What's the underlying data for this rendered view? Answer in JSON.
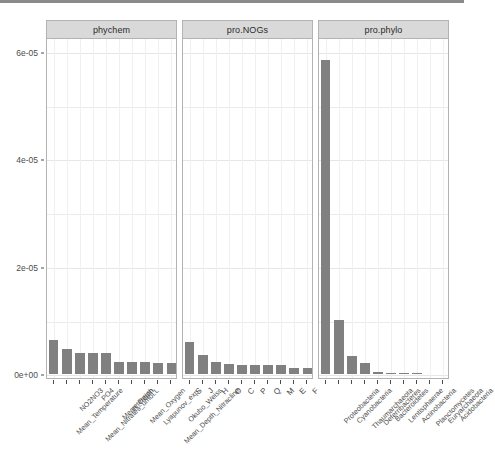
{
  "chart_data": {
    "type": "bar",
    "title": "",
    "xlabel": "",
    "ylabel": "",
    "ylim": [
      0,
      6.32e-05
    ],
    "grid": true,
    "legend_position": "none",
    "facet_strips": [
      "phychem",
      "pro.NOGs",
      "pro.phylo"
    ],
    "y_ticks": [
      "0e+00",
      "2e-05",
      "4e-05",
      "6e-05"
    ],
    "y_tick_values": [
      0,
      2e-05,
      4e-05,
      6e-05
    ],
    "bar_color": "#808080",
    "strip_color": "#d9d9d9",
    "panel_border_color": "#b3b3b3",
    "grid_color": "#ebebeb",
    "panels": [
      {
        "name": "phychem",
        "categories": [
          "Mean_Temperature",
          "NO2NO3",
          "Mean_Nitrates_umol.L",
          "PO4",
          "Mean_Depth",
          "retention",
          "Mean_Oxygen",
          "Lyapunov_exp.",
          "Mean_Depth_Nitracline",
          "Okubo_Weiss"
        ],
        "values": [
          6.3e-06,
          4.6e-06,
          4e-06,
          4e-06,
          3.9e-06,
          2.3e-06,
          2.2e-06,
          2.2e-06,
          2.1e-06,
          2.1e-06
        ]
      },
      {
        "name": "pro.NOGs",
        "categories": [
          "S",
          "J",
          "H",
          "O",
          "C",
          "P",
          "Q",
          "M",
          "E",
          "F"
        ],
        "values": [
          5.9e-06,
          3.5e-06,
          2.3e-06,
          1.8e-06,
          1.7e-06,
          1.7e-06,
          1.6e-06,
          1.6e-06,
          1.2e-06,
          1.1e-06
        ]
      },
      {
        "name": "pro.phylo",
        "categories": [
          "Proteobacteria",
          "Cyanobacteria",
          "Thaumarchaeota",
          "Deferribacteres",
          "Bacteroidetes",
          "Lentisphaerae",
          "Actinobacteria",
          "Planctomycetes",
          "Euryarchaeota",
          "Acidobacteria"
        ],
        "values": [
          5.85e-05,
          1.01e-05,
          3.3e-06,
          2.1e-06,
          4e-07,
          2e-07,
          1e-07,
          1e-07,
          0.0,
          0.0
        ]
      }
    ]
  }
}
